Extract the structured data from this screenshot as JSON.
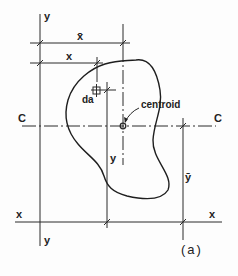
{
  "figure": {
    "caption": "(a)",
    "labels": {
      "y_axis_top": "y",
      "y_axis_bottom": "y",
      "x_axis_left": "x",
      "x_axis_right": "x",
      "c_axis_left": "C",
      "c_axis_right": "C",
      "x_bar": "x̄",
      "x_dim": "x",
      "y_bar": "ȳ",
      "y_dim": "y",
      "da": "da",
      "centroid": "centroid"
    },
    "colors": {
      "ink": "#222222",
      "background": "#fdfdfd"
    }
  }
}
